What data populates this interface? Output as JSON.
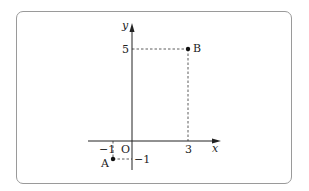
{
  "diagram": {
    "type": "coordinate-plane",
    "axes": {
      "x_label": "x",
      "y_label": "y",
      "origin_label": "O"
    },
    "ticks": {
      "x": [
        {
          "value": -1,
          "label": "-1"
        },
        {
          "value": 3,
          "label": "3"
        }
      ],
      "y": [
        {
          "value": 5,
          "label": "5"
        },
        {
          "value": -1,
          "label": "-1"
        }
      ]
    },
    "points": [
      {
        "name": "A",
        "x": -1,
        "y": -1,
        "label": "A"
      },
      {
        "name": "B",
        "x": 3,
        "y": 5,
        "label": "B"
      }
    ],
    "labels": {
      "x_axis": "x",
      "y_axis": "y",
      "origin": "O",
      "tick_x_neg1": "−1",
      "tick_x_3": "3",
      "tick_y_5": "5",
      "tick_y_neg1": "−1",
      "point_a": "A",
      "point_b": "B"
    }
  }
}
